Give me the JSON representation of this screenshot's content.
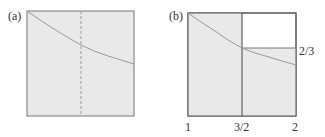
{
  "panel_a": {
    "label": "(a)",
    "fill_color": "#e9e9e9",
    "border_color": "#777777",
    "curve_color": "#999999",
    "box": {
      "x": 27,
      "y": 11,
      "w": 107,
      "h": 105
    },
    "dashed_divider_x": 81,
    "curve_points": "27,11 40,20 54,29 67,37 81,45 94,51 108,56 121,60 134,64"
  },
  "panel_b": {
    "label": "(b)",
    "fill_color": "#e9e9e9",
    "border_color": "#555555",
    "curve_color": "#999999",
    "box": {
      "x": 188,
      "y": 13,
      "w": 108,
      "h": 103
    },
    "divider_x": 242,
    "level_y": 48,
    "level_label": "2/3",
    "x_ticks": [
      {
        "label": "1",
        "x": 188
      },
      {
        "label": "3/2",
        "x": 242
      },
      {
        "label": "2",
        "x": 296
      }
    ],
    "curve_points": "188,13 201,22 215,31 228,40 242,48 255,53 269,57 282,61 296,65"
  }
}
